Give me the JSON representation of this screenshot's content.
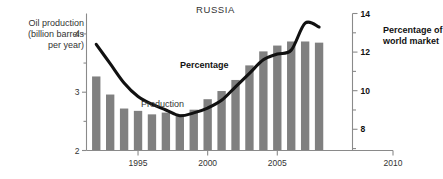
{
  "chart_data": {
    "type": "bar",
    "title": "RUSSIA",
    "xlabel": "",
    "ylabel": "Oil production (billion barrels per year)",
    "y2label": "Percentage of world market",
    "xlim": [
      1991.3,
      2010.4
    ],
    "ylim": [
      2,
      4.35
    ],
    "y2lim": [
      6.9,
      14
    ],
    "grid": false,
    "legend_position": "inline-annotations",
    "x_ticks": [
      "1995",
      "2000",
      "2005",
      "2010"
    ],
    "x_tick_values": [
      1995,
      2000,
      2005,
      2010
    ],
    "y_ticks": [
      "2",
      "3",
      "4"
    ],
    "y_tick_values": [
      2,
      3,
      4
    ],
    "y_minor_ticks": [
      2.5,
      3.5
    ],
    "y2_ticks": [
      "8",
      "10",
      "12",
      "14"
    ],
    "y2_tick_values": [
      8,
      10,
      12,
      14
    ],
    "y2_minor_ticks": [
      7,
      9,
      11,
      13
    ],
    "categories": [
      1992,
      1993,
      1994,
      1995,
      1996,
      1997,
      1998,
      1999,
      2000,
      2001,
      2002,
      2003,
      2004,
      2005,
      2006,
      2007,
      2008
    ],
    "series": [
      {
        "name": "Production",
        "type": "bar",
        "axis": "left",
        "unit": "billion barrels per year",
        "color": "#808080",
        "values": [
          3.27,
          2.96,
          2.72,
          2.68,
          2.62,
          2.65,
          2.62,
          2.7,
          2.88,
          3.02,
          3.21,
          3.46,
          3.7,
          3.8,
          3.87,
          3.87,
          3.85
        ]
      },
      {
        "name": "Percentage",
        "type": "line",
        "axis": "right",
        "unit": "percent of world market",
        "color": "#111111",
        "values": [
          12.4,
          11.4,
          10.4,
          9.7,
          9.3,
          9.0,
          8.7,
          8.85,
          9.1,
          9.5,
          10.2,
          10.9,
          11.6,
          11.9,
          12.1,
          13.5,
          13.3
        ]
      }
    ]
  },
  "labels": {
    "title": "RUSSIA",
    "left_axis_title": "Oil production\n(billion barrels\nper year)",
    "right_axis_title": "Percentage of\nworld market",
    "series_percentage": "Percentage",
    "series_production": "Production"
  }
}
